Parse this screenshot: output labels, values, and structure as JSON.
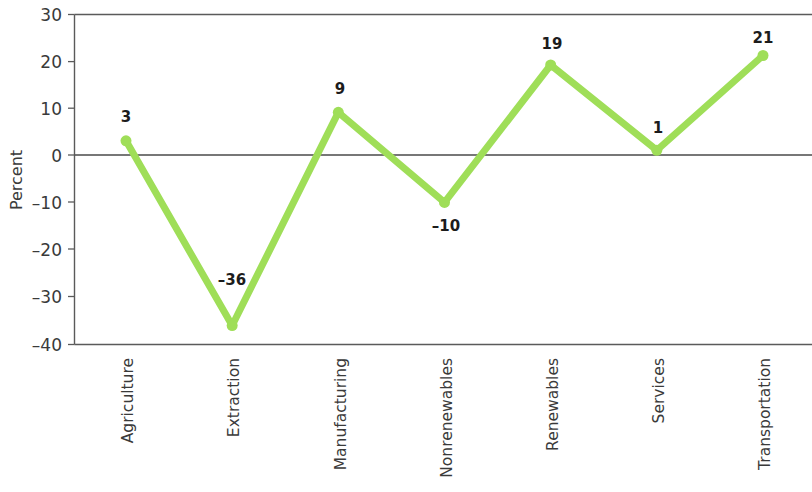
{
  "chart_data": {
    "type": "line",
    "title": "",
    "subtitle": "",
    "xlabel": "",
    "ylabel": "Percent",
    "categories": [
      "Agriculture",
      "Extraction",
      "Manufacturing",
      "Nonrenewables",
      "Renewables",
      "Services",
      "Transportation"
    ],
    "values": [
      3,
      -36,
      9,
      -10,
      19,
      1,
      21
    ],
    "point_labels": [
      "3",
      "–36",
      "9",
      "–10",
      "19",
      "1",
      "21"
    ],
    "series": [
      {
        "name": "Percent change",
        "values": [
          3,
          -36,
          9,
          -10,
          19,
          1,
          21
        ],
        "color": "#9FDE58"
      }
    ],
    "ylim": [
      -40,
      30
    ],
    "yticks": [
      30,
      20,
      10,
      0,
      -10,
      -20,
      -30,
      -40
    ],
    "ytick_labels": [
      "30",
      "20",
      "10",
      "0",
      "–10",
      "–20",
      "–30",
      "–40"
    ],
    "grid": false,
    "zero_line": true,
    "legend": "none",
    "marker": "circle",
    "line_width": 7,
    "marker_size": 11,
    "xtick_label_rotation": -90
  },
  "colors": {
    "series_green": "#9FDE58",
    "axis_gray": "#5a5a5a",
    "text_dark": "#3a3a3a",
    "label_black": "#1c1c1c",
    "background": "#ffffff"
  }
}
